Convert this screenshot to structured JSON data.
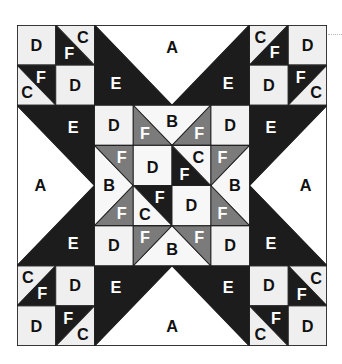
{
  "diagram": {
    "title": "",
    "grid_size": 8,
    "colors": {
      "light": "#efefef",
      "white": "#ffffff",
      "dark": "#1c1c1c",
      "gray": "#7b7b7b",
      "line": "#222222",
      "text_dark": "#111111",
      "text_light": "#ffffff"
    },
    "legend_pieces": [
      "A",
      "B",
      "C",
      "D",
      "E",
      "F"
    ],
    "labels": {
      "A": "A",
      "B": "B",
      "C": "C",
      "D": "D",
      "E": "E",
      "F": "F"
    },
    "regions": {
      "corner_top_left": [
        "D",
        "F",
        "C",
        "F",
        "C",
        "D"
      ],
      "corner_top_right": [
        "C",
        "F",
        "D",
        "D",
        "F",
        "C"
      ],
      "corner_bottom_left": [
        "C",
        "F",
        "D",
        "D",
        "F",
        "C"
      ],
      "corner_bottom_right": [
        "D",
        "F",
        "C",
        "F",
        "C",
        "D"
      ],
      "side_top": [
        "E",
        "A",
        "E"
      ],
      "side_left": [
        "E",
        "A",
        "E"
      ],
      "side_right": [
        "E",
        "A",
        "E"
      ],
      "side_bottom": [
        "E",
        "A",
        "E"
      ],
      "center_corners": [
        "D",
        "D",
        "D",
        "D"
      ],
      "center_flying_geese": [
        "F",
        "B",
        "F",
        "F",
        "B",
        "F",
        "F",
        "B",
        "F",
        "F",
        "B",
        "F"
      ],
      "center_core": [
        "D",
        "F",
        "C",
        "F",
        "C",
        "D"
      ]
    }
  }
}
